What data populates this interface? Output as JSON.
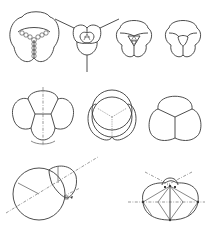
{
  "figure": {
    "type": "technical line diagram",
    "rows": [
      {
        "row": 1,
        "panels": [
          {
            "id": "three-cell-cluster-with-beaded-borders",
            "description": "Three rounded cells separated by beaded (chain) walls meeting at center"
          },
          {
            "id": "triangular-junction-with-extended-legs",
            "description": "Small four-cell triangular cluster with three long radiating lines"
          },
          {
            "id": "three-cell-cluster-small-center-triangle",
            "description": "Three cells with small central triangular cell subdivided"
          },
          {
            "id": "three-cell-cluster-curved-center-triangle",
            "description": "Three cells with a single curved central triangle"
          }
        ]
      },
      {
        "row": 2,
        "panels": [
          {
            "id": "four-cell-cluster-with-axis",
            "description": "Four-cell cluster with vertical dash-dot symmetry axis"
          },
          {
            "id": "overlapping-circles-construction",
            "description": "Overlapping circles with dotted Y-junction construction lines"
          },
          {
            "id": "three-cell-cluster-y-junction",
            "description": "Three equal cells meeting at a Y junction"
          }
        ]
      },
      {
        "row": 3,
        "panels": [
          {
            "id": "two-bubble-double-bubble-construction",
            "description": "Large and small bubble with dash-dot centerline and radii"
          },
          {
            "id": "lens-cluster-construction",
            "description": "Lens-shaped cluster with horizontal dash-dot axis and radial construction lines"
          }
        ]
      }
    ]
  }
}
